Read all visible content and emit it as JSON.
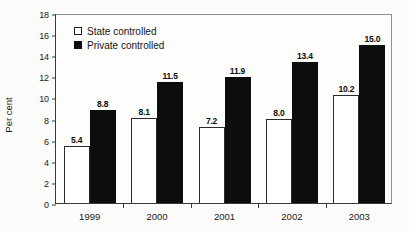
{
  "chart_data": {
    "type": "bar",
    "title": "",
    "xlabel": "",
    "ylabel": "Per cent",
    "ylim": [
      0,
      18
    ],
    "ytick_step": 2,
    "yticks": [
      "18",
      "16",
      "14",
      "12",
      "10",
      "8",
      "6",
      "4",
      "2",
      "0"
    ],
    "grid": false,
    "legend_position": "top-left inside plot area",
    "categories": [
      "1999",
      "2000",
      "2001",
      "2002",
      "2003"
    ],
    "series": [
      {
        "name": "State controlled",
        "color": "#ffffff",
        "edge_color": "#2a2a2a",
        "values": [
          5.4,
          8.1,
          7.2,
          8.0,
          10.2
        ],
        "labels": [
          "5.4",
          "8.1",
          "7.2",
          "8.0",
          "10.2"
        ]
      },
      {
        "name": "Private controlled",
        "color": "#0d0d0d",
        "edge_color": "#0d0d0d",
        "values": [
          8.8,
          11.5,
          11.9,
          13.4,
          15.0
        ],
        "labels": [
          "8.8",
          "11.5",
          "11.9",
          "13.4",
          "15.0"
        ]
      }
    ]
  },
  "legend": {
    "items": [
      {
        "label": "State controlled",
        "swatch": "hollow-square-icon"
      },
      {
        "label": "Private controlled",
        "swatch": "filled-square-icon"
      }
    ]
  },
  "axes": {
    "y_title": "Per cent"
  }
}
